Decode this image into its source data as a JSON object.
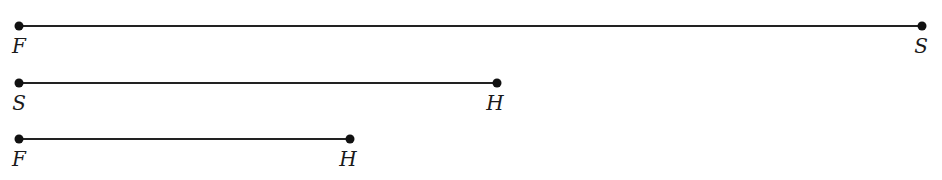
{
  "diagram": {
    "segments": [
      {
        "id": "FS",
        "y": 26,
        "x1": 19,
        "x2": 922,
        "start_label": "F",
        "end_label": "S",
        "label_y": 36
      },
      {
        "id": "SH",
        "y": 83,
        "x1": 19,
        "x2": 497,
        "start_label": "S",
        "end_label": "H",
        "label_y": 93
      },
      {
        "id": "FH",
        "y": 139,
        "x1": 19,
        "x2": 350,
        "start_label": "F",
        "end_label": "H",
        "label_y": 149
      }
    ],
    "colors": {
      "line": "#222222",
      "point": "#111111",
      "label": "#1a1a1a"
    }
  }
}
